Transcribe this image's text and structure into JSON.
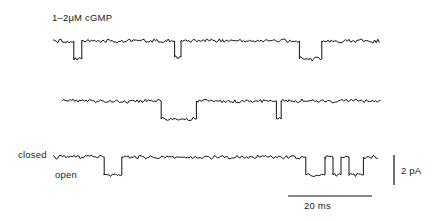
{
  "figure": {
    "title": "1–2μM cGMP",
    "closed_label": "closed",
    "open_label": "open",
    "vertical_scale_label": "2 pA",
    "horizontal_scale_label": "20 ms",
    "stroke_color": "#111111",
    "background_color": "#ffffff",
    "text_color": "#1a1a1a"
  },
  "chart_data": {
    "type": "line",
    "title": "1–2μM cGMP",
    "subtitle": "",
    "xlabel": "time",
    "ylabel": "current",
    "grid": false,
    "legend": null,
    "annotations": [
      "closed",
      "open"
    ],
    "scale_bars": {
      "vertical": {
        "label": "2 pA",
        "value": 2,
        "unit": "pA",
        "pixels": 30
      },
      "horizontal": {
        "label": "20 ms",
        "value": 20,
        "unit": "ms",
        "pixels": 84
      }
    },
    "levels": {
      "closed_pa": 0,
      "open_pa": -1.2,
      "open_px_offset": 18
    },
    "noise_amplitude_px": 1.6,
    "sweeps": [
      {
        "name": "sweep-1",
        "x_start": 53,
        "x_end": 380,
        "baseline_y": 41,
        "events": [
          {
            "start": 73,
            "end": 81,
            "depth": 18
          },
          {
            "start": 174,
            "end": 180,
            "depth": 16
          },
          {
            "start": 298,
            "end": 321,
            "depth": 18
          }
        ]
      },
      {
        "name": "sweep-2",
        "x_start": 62,
        "x_end": 382,
        "baseline_y": 101,
        "events": [
          {
            "start": 160,
            "end": 196,
            "depth": 18
          },
          {
            "start": 275,
            "end": 280,
            "depth": 18
          }
        ]
      },
      {
        "name": "sweep-3",
        "x_start": 53,
        "x_end": 378,
        "baseline_y": 157,
        "events": [
          {
            "start": 103,
            "end": 121,
            "depth": 18
          },
          {
            "start": 305,
            "end": 325,
            "depth": 18
          },
          {
            "start": 333,
            "end": 341,
            "depth": 18
          },
          {
            "start": 349,
            "end": 362,
            "depth": 18
          }
        ]
      }
    ]
  }
}
